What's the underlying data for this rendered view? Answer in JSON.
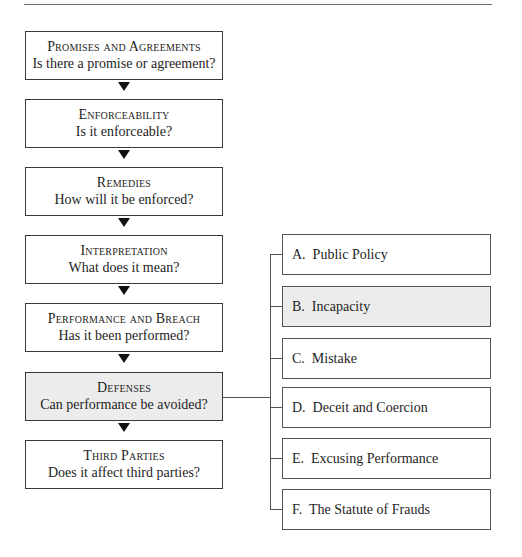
{
  "diagram": {
    "steps": [
      {
        "title": "Promises and Agreements",
        "question": "Is there a promise or agreement?",
        "highlighted": false
      },
      {
        "title": "Enforceability",
        "question": "Is it enforceable?",
        "highlighted": false
      },
      {
        "title": "Remedies",
        "question": "How will it be enforced?",
        "highlighted": false
      },
      {
        "title": "Interpretation",
        "question": "What does it mean?",
        "highlighted": false
      },
      {
        "title": "Performance and Breach",
        "question": "Has it been performed?",
        "highlighted": false
      },
      {
        "title": "Defenses",
        "question": "Can performance be avoided?",
        "highlighted": true
      },
      {
        "title": "Third Parties",
        "question": "Does it affect third parties?",
        "highlighted": false
      }
    ],
    "defenses": [
      {
        "label": "A.  Public Policy",
        "highlighted": false
      },
      {
        "label": "B.  Incapacity",
        "highlighted": true
      },
      {
        "label": "C.  Mistake",
        "highlighted": false
      },
      {
        "label": "D.  Deceit and Coercion",
        "highlighted": false
      },
      {
        "label": "E.  Excusing Performance",
        "highlighted": false
      },
      {
        "label": "F.  The Statute of Frauds",
        "highlighted": false
      }
    ],
    "colors": {
      "highlight_fill": "#ececec",
      "border": "#3a3a3a",
      "arrow": "#111111"
    }
  }
}
